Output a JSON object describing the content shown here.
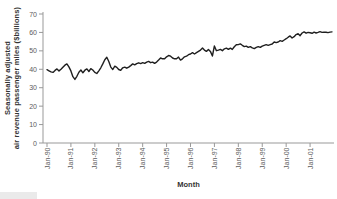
{
  "figure": {
    "y_axis_title_line1": "Seasonally adjusted",
    "y_axis_title_line2": "air revenue passenger miles ($billions)",
    "x_axis_title": "Month"
  },
  "colors": {
    "background": "#ffffff",
    "line": "#1f1f1f",
    "axis": "#999999",
    "tick_label": "#5c5c5c",
    "title": "#333333",
    "artifact": "#eaeaea"
  },
  "chart_data": {
    "type": "line",
    "title": "",
    "xlabel": "Month",
    "ylabel": "Seasonally adjusted air revenue passenger miles ($billions)",
    "x_start": "Jan-1990",
    "x_end": "Dec-2001",
    "frequency": "monthly",
    "grid": false,
    "legend": "none",
    "ylim": [
      0,
      70
    ],
    "y_ticks": [
      0,
      10,
      20,
      30,
      40,
      50,
      60,
      70
    ],
    "x_tick_labels": [
      "Jan-90",
      "Jan-91",
      "Jan-92",
      "Jan-93",
      "Jan-94",
      "Jan-95",
      "Jan-96",
      "Jan-97",
      "Jan-98",
      "Jan-99",
      "Jan-00",
      "Jan-01"
    ],
    "x_tick_month_interval": 12,
    "series": [
      {
        "name": "Air revenue passenger miles (seasonally adjusted)",
        "values": [
          39.8,
          39.2,
          38.6,
          38.3,
          39.4,
          40.2,
          39.1,
          40.0,
          41.1,
          42.2,
          42.9,
          41.3,
          39.1,
          36.0,
          34.5,
          36.2,
          38.4,
          39.6,
          38.1,
          39.5,
          40.2,
          38.8,
          40.3,
          39.6,
          38.3,
          37.7,
          39.2,
          40.8,
          42.9,
          45.2,
          46.5,
          44.2,
          41.2,
          39.9,
          41.7,
          41.0,
          39.9,
          39.4,
          40.8,
          41.2,
          40.6,
          41.2,
          42.0,
          42.9,
          42.4,
          43.1,
          43.5,
          43.1,
          43.6,
          43.2,
          43.9,
          44.3,
          43.6,
          43.9,
          43.2,
          43.9,
          45.0,
          46.1,
          45.7,
          45.7,
          46.8,
          47.5,
          47.1,
          46.1,
          45.7,
          45.7,
          46.6,
          45.0,
          45.7,
          46.8,
          47.1,
          47.9,
          48.3,
          49.0,
          48.3,
          49.0,
          49.7,
          50.4,
          51.5,
          50.4,
          49.7,
          50.8,
          49.7,
          47.2,
          52.7,
          50.1,
          50.4,
          50.8,
          50.1,
          51.1,
          51.5,
          50.8,
          51.5,
          50.8,
          52.2,
          53.3,
          53.4,
          53.8,
          53.0,
          52.3,
          52.6,
          51.9,
          52.3,
          51.6,
          51.2,
          51.9,
          52.3,
          51.9,
          52.6,
          53.0,
          53.4,
          53.0,
          53.4,
          53.7,
          54.8,
          54.5,
          54.8,
          55.5,
          55.2,
          55.9,
          56.6,
          57.4,
          58.1,
          57.0,
          57.7,
          58.8,
          59.3,
          58.2,
          59.7,
          60.3,
          59.6,
          60.0,
          59.8,
          59.5,
          60.1,
          59.7,
          60.0,
          60.4,
          60.0,
          60.2,
          60.1,
          59.9,
          60.2,
          60.3
        ]
      }
    ]
  }
}
